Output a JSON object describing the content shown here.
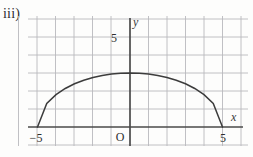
{
  "figure": {
    "part_label": "iii)",
    "background_color": "#fdfdfc",
    "grid_color": "#b9b9bd",
    "axis_color": "#4a4a4a",
    "curve_color": "#3c3c3c"
  },
  "axes": {
    "x_axis_name": "x",
    "y_axis_name": "y",
    "origin_label": "O",
    "x_left_tick_label": "−5",
    "x_right_tick_label": "5",
    "y_tick_label": "5"
  },
  "chart_data": {
    "type": "line",
    "title": "",
    "xlabel": "x",
    "ylabel": "y",
    "xlim": [
      -6.9,
      6.6
    ],
    "ylim": [
      -1.1,
      6.9
    ],
    "grid": true,
    "grid_step": 1,
    "legend": "none",
    "annotations": [
      {
        "text": "−5",
        "x": -5,
        "y": 0
      },
      {
        "text": "5",
        "x": 5,
        "y": 0
      },
      {
        "text": "5",
        "x": 0,
        "y": 5
      },
      {
        "text": "O",
        "x": -0.4,
        "y": -0.55
      }
    ],
    "series": [
      {
        "name": "upper half ellipse",
        "description": "semi-ellipse, semi-axis a = 5 along x, semi-axis b = 3 along y, upper half only",
        "x": [
          -5,
          -4.5,
          -4,
          -3.5,
          -3,
          -2.5,
          -2,
          -1.5,
          -1,
          -0.5,
          0,
          0.5,
          1,
          1.5,
          2,
          2.5,
          3,
          3.5,
          4,
          4.5,
          5
        ],
        "y": [
          0,
          1.31,
          1.8,
          2.14,
          2.4,
          2.6,
          2.75,
          2.86,
          2.94,
          2.98,
          3,
          2.98,
          2.94,
          2.86,
          2.75,
          2.6,
          2.4,
          2.14,
          1.8,
          1.31,
          0
        ]
      }
    ],
    "x_ticks": [
      -5,
      5
    ],
    "y_ticks": [
      5
    ]
  }
}
